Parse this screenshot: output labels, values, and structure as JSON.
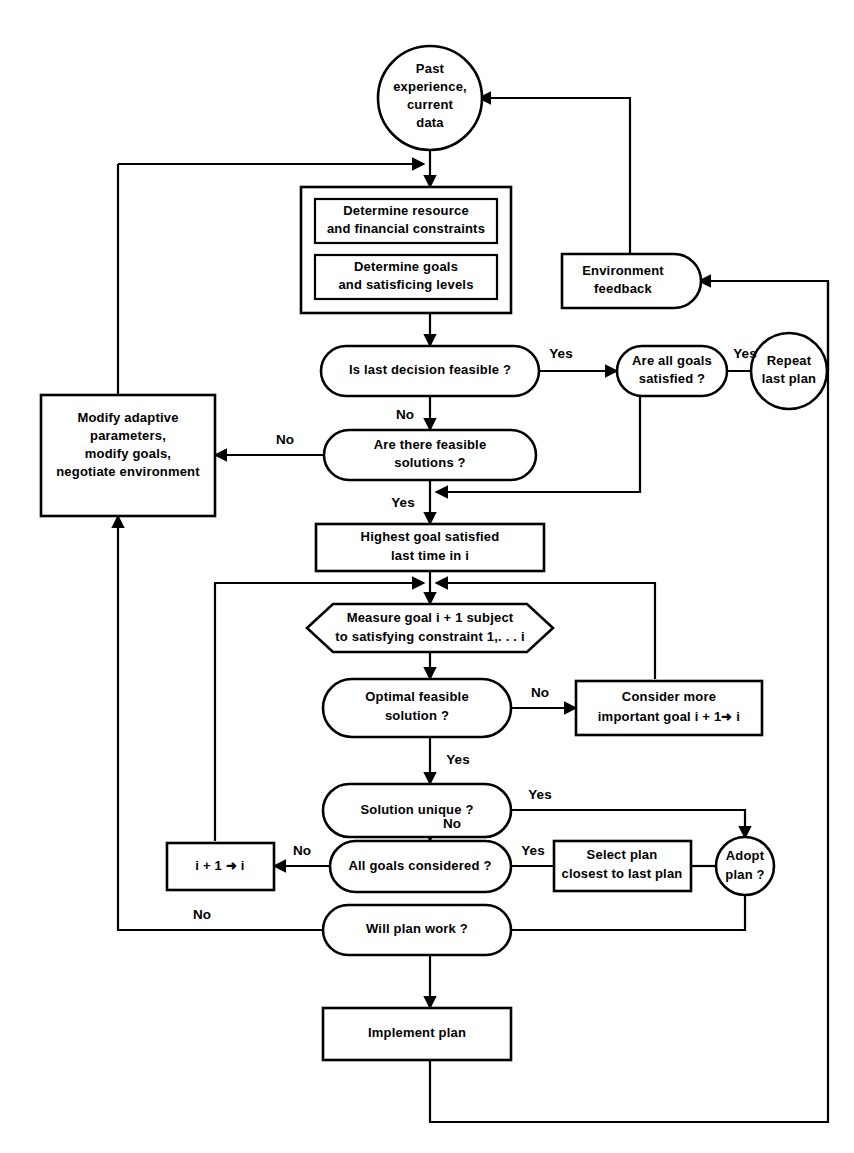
{
  "diagram": {
    "type": "flowchart",
    "nodes": {
      "past_experience": {
        "label_lines": [
          "Past",
          "experience,",
          "current",
          "data"
        ],
        "shape": "circle"
      },
      "determine_resource": {
        "label_lines": [
          "Determine resource",
          "and financial constraints"
        ],
        "shape": "rect"
      },
      "determine_goals": {
        "label_lines": [
          "Determine goals",
          "and satisficing levels"
        ],
        "shape": "rect"
      },
      "environment_feedback": {
        "label_lines": [
          "Environment",
          "feedback"
        ],
        "shape": "rounded-right"
      },
      "is_last_decision_feasible": {
        "label_lines": [
          "Is last decision feasible ?"
        ],
        "shape": "stadium"
      },
      "are_all_goals_satisfied": {
        "label_lines": [
          "Are all goals",
          "satisfied ?"
        ],
        "shape": "stadium"
      },
      "repeat_last_plan": {
        "label_lines": [
          "Repeat",
          "last plan"
        ],
        "shape": "circle"
      },
      "are_there_feasible_solutions": {
        "label_lines": [
          "Are there feasible",
          "solutions ?"
        ],
        "shape": "stadium"
      },
      "modify_adaptive": {
        "label_lines": [
          "Modify adaptive",
          "parameters,",
          "modify goals,",
          "negotiate environment"
        ],
        "shape": "rect"
      },
      "highest_goal_satisfied": {
        "label_lines": [
          "Highest goal satisfied",
          "last time in i"
        ],
        "shape": "rect"
      },
      "measure_goal": {
        "label_lines": [
          "Measure goal i + 1 subject",
          "to satisfying constraint 1,. . . i"
        ],
        "shape": "hexagon"
      },
      "optimal_feasible_solution": {
        "label_lines": [
          "Optimal feasible",
          "solution ?"
        ],
        "shape": "stadium"
      },
      "consider_more_important_goal": {
        "label_lines": [
          "Consider more",
          "important goal i + 1➜ i"
        ],
        "shape": "rect"
      },
      "solution_unique": {
        "label_lines": [
          "Solution unique ?"
        ],
        "shape": "stadium"
      },
      "all_goals_considered": {
        "label_lines": [
          "All goals considered ?"
        ],
        "shape": "stadium"
      },
      "increment_i": {
        "label_lines": [
          "i + 1 ➜ i"
        ],
        "shape": "rect"
      },
      "select_plan_closest": {
        "label_lines": [
          "Select plan",
          "closest to last plan"
        ],
        "shape": "rect"
      },
      "adopt_plan": {
        "label_lines": [
          "Adopt",
          "plan ?"
        ],
        "shape": "circle"
      },
      "will_plan_work": {
        "label_lines": [
          "Will plan work ?"
        ],
        "shape": "stadium"
      },
      "implement_plan": {
        "label_lines": [
          "Implement plan"
        ],
        "shape": "rect"
      }
    },
    "edge_labels": {
      "feasible_yes": "Yes",
      "feasible_no": "No",
      "all_goals_satisfied_yes": "Yes",
      "feasible_solutions_no": "No",
      "feasible_solutions_yes": "Yes",
      "optimal_no": "No",
      "optimal_yes": "Yes",
      "solution_unique_yes": "Yes",
      "all_considered_no": "No",
      "all_considered_yes": "Yes",
      "will_plan_work_no": "No"
    },
    "colors": {
      "stroke": "#000000",
      "fill": "#ffffff",
      "text": "#000000"
    }
  }
}
